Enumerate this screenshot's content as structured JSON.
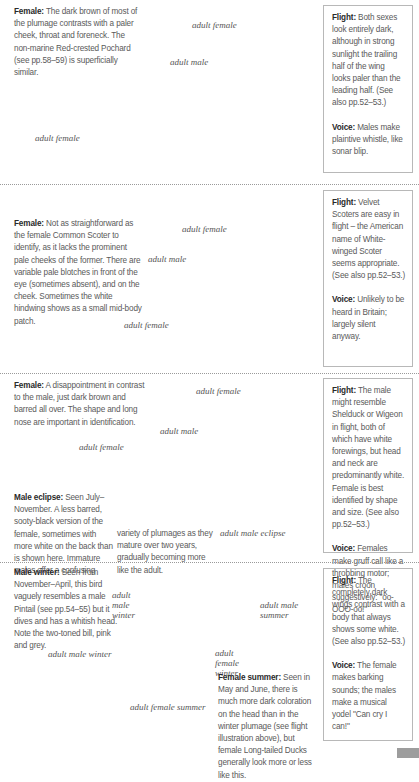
{
  "sections": [
    {
      "id": "common-scoter",
      "description": {
        "label": "Female:",
        "text": "The dark brown of most of the plumage contrasts with a paler cheek, throat and foreneck. The non-marine Red-crested Pochard (see pp.58–59) is superficially similar."
      },
      "captions": {
        "flight_female": "adult female",
        "flight_male": "adult male",
        "swim_female": "adult female"
      },
      "sidebar": {
        "flight": {
          "label": "Flight:",
          "text": "Both sexes look entirely dark, although in strong sunlight the trailing half of the wing looks paler than the leading half. (See also pp.52–53.)"
        },
        "voice": {
          "label": "Voice:",
          "text": "Males make plaintive whistle, like sonar blip."
        }
      }
    },
    {
      "id": "velvet-scoter",
      "description": {
        "label": "Female:",
        "text": "Not as straightforward as the female Common Scoter to identify, as it lacks the prominent pale cheeks of the former. There are variable pale blotches in front of the eye (sometimes absent), and on the cheek. Sometimes the white hindwing shows as a small mid-body patch."
      },
      "captions": {
        "flight_female": "adult female",
        "flight_male": "adult male",
        "swim_female": "adult female"
      },
      "sidebar": {
        "flight": {
          "label": "Flight:",
          "text": "Velvet Scoters are easy in flight – the American name of White-winged Scoter seems appropriate. (See also pp.52–53.)"
        },
        "voice": {
          "label": "Voice:",
          "text": "Unlikely to be heard in Britain; largely silent anyway."
        }
      }
    },
    {
      "id": "eider",
      "description": {
        "label": "Female:",
        "text": "A disappointment in contrast to the male, just dark brown and barred all over. The shape and long nose are important in identification."
      },
      "eclipse": {
        "label": "Male eclipse:",
        "text_col1": "Seen July–November. A less barred, sooty-black version of the female, sometimes with more white on the back than is shown here. Immature males offer a confusing",
        "text_col2": "variety of plumages as they mature over two years, gradually becoming more like the adult."
      },
      "captions": {
        "flight_female": "adult female",
        "flight_male": "adult male",
        "swim_female": "adult female",
        "swim_eclipse": "adult male eclipse"
      },
      "sidebar": {
        "flight": {
          "label": "Flight:",
          "text": "The male might resemble Shelduck or Wigeon in flight, both of which have white forewings, but head and neck are predominantly white. Female is best identified by shape and size. (See also pp.52–53.)"
        },
        "voice": {
          "label": "Voice:",
          "text": "Females make gruff call like a throbbing motor; males croon suggestively: \"oo-OOO-oo!\""
        }
      }
    },
    {
      "id": "long-tailed-duck",
      "description": {
        "label": "Male winter:",
        "text": "Seen from November–April, this bird vaguely resembles a male Pintail (see pp.54–55) but it dives and has a whitish head. Note the two-toned bill, pink and grey."
      },
      "female_summer": {
        "label": "Female summer:",
        "text": "Seen in May and June, there is much more dark coloration on the head than in the winter plumage (see flight illustration above), but female Long-tailed Ducks generally look more or less like this."
      },
      "captions": {
        "flight_male_winter": "adult male winter",
        "flight_male_summer": "adult male summer",
        "flight_female_winter": "adult female winter",
        "swim_male_winter": "adult male winter",
        "swim_female_summer": "adult female summer"
      },
      "sidebar": {
        "flight": {
          "label": "Flight:",
          "text": "The completely dark wings contrast with a body that always shows some white. (See also pp.52–53.)"
        },
        "voice": {
          "label": "Voice:",
          "text": "The female makes barking sounds; the males make a musical yodel \"Can cry I can!\""
        }
      }
    }
  ],
  "colors": {
    "text": "#5a5a5a",
    "label": "#2a2a2a",
    "bird_dark": "#1e1e1e",
    "border": "#b8b8b8",
    "page_tab": "#9d9d9d"
  }
}
